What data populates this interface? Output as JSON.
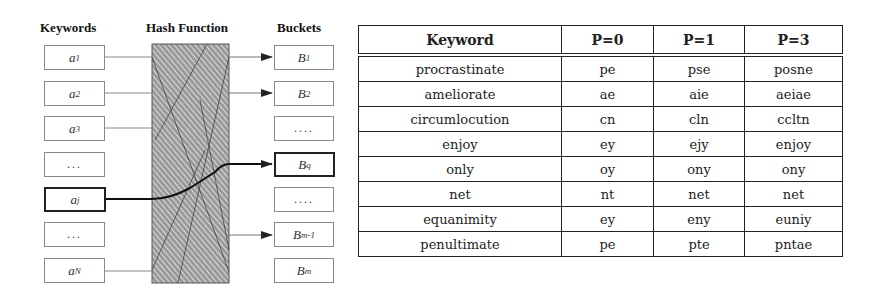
{
  "diagram": {
    "headers": {
      "keywords": "Keywords",
      "hash_function": "Hash Function",
      "buckets": "Buckets"
    },
    "keywords": [
      {
        "base": "a",
        "sub": "1",
        "highlighted": false
      },
      {
        "base": "a",
        "sub": "2",
        "highlighted": false
      },
      {
        "base": "a",
        "sub": "3",
        "highlighted": false
      },
      {
        "base": "...",
        "sub": "",
        "highlighted": false
      },
      {
        "base": "a",
        "sub": "j",
        "highlighted": true
      },
      {
        "base": "...",
        "sub": "",
        "highlighted": false
      },
      {
        "base": "a",
        "sub": "N",
        "highlighted": false
      }
    ],
    "buckets": [
      {
        "base": "B",
        "sub": "1",
        "highlighted": false
      },
      {
        "base": "B",
        "sub": "2",
        "highlighted": false
      },
      {
        "base": "....",
        "sub": "",
        "highlighted": false
      },
      {
        "base": "B",
        "sub": "q",
        "highlighted": true
      },
      {
        "base": "....",
        "sub": "",
        "highlighted": false
      },
      {
        "base": "B",
        "sub": "m-1",
        "highlighted": false
      },
      {
        "base": "B",
        "sub": "m",
        "highlighted": false
      }
    ]
  },
  "table": {
    "columns": [
      "Keyword",
      "P=0",
      "P=1",
      "P=3"
    ],
    "rows": [
      [
        "procrastinate",
        "pe",
        "pse",
        "posne"
      ],
      [
        "ameliorate",
        "ae",
        "aie",
        "aeiae"
      ],
      [
        "circumlocution",
        "cn",
        "cln",
        "ccltn"
      ],
      [
        "enjoy",
        "ey",
        "ejy",
        "enjoy"
      ],
      [
        "only",
        "oy",
        "ony",
        "ony"
      ],
      [
        "net",
        "nt",
        "net",
        "net"
      ],
      [
        "equanimity",
        "ey",
        "eny",
        "euniy"
      ],
      [
        "penultimate",
        "pe",
        "pte",
        "pntae"
      ]
    ]
  }
}
